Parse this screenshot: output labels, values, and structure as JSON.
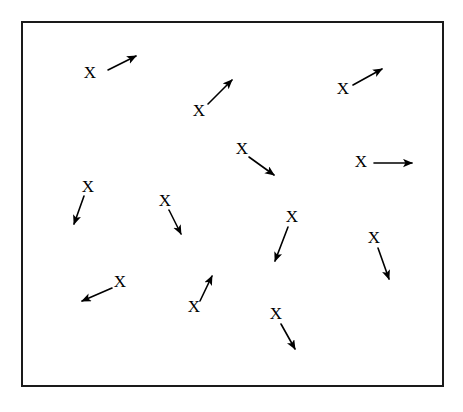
{
  "figure": {
    "background_color": "#ffffff",
    "ink_color": "#000000",
    "frame": {
      "name": "outer-border",
      "x": 22,
      "y": 22,
      "width": 421,
      "height": 364,
      "stroke_color": "#1a1a1a",
      "stroke_width": 2
    },
    "marker_glyph": "X",
    "marker_count": 13,
    "markers": [
      {
        "id": 1,
        "label": "X",
        "label_x": 90,
        "label_y": 74,
        "arrow": {
          "x1": 108,
          "y1": 70,
          "x2": 136,
          "y2": 56
        },
        "direction": "up-right"
      },
      {
        "id": 2,
        "label": "X",
        "label_x": 199,
        "label_y": 112,
        "arrow": {
          "x1": 208,
          "y1": 104,
          "x2": 232,
          "y2": 80
        },
        "direction": "up-right"
      },
      {
        "id": 3,
        "label": "X",
        "label_x": 343,
        "label_y": 90,
        "arrow": {
          "x1": 353,
          "y1": 85,
          "x2": 382,
          "y2": 69
        },
        "direction": "up-right"
      },
      {
        "id": 4,
        "label": "X",
        "label_x": 242,
        "label_y": 150,
        "arrow": {
          "x1": 249,
          "y1": 157,
          "x2": 274,
          "y2": 175
        },
        "direction": "down-right"
      },
      {
        "id": 5,
        "label": "X",
        "label_x": 361,
        "label_y": 163,
        "arrow": {
          "x1": 374,
          "y1": 163,
          "x2": 412,
          "y2": 163
        },
        "direction": "right"
      },
      {
        "id": 6,
        "label": "X",
        "label_x": 88,
        "label_y": 188,
        "arrow": {
          "x1": 84,
          "y1": 196,
          "x2": 74,
          "y2": 224
        },
        "direction": "down-left"
      },
      {
        "id": 7,
        "label": "X",
        "label_x": 165,
        "label_y": 202,
        "arrow": {
          "x1": 169,
          "y1": 210,
          "x2": 181,
          "y2": 234
        },
        "direction": "down-right"
      },
      {
        "id": 8,
        "label": "X",
        "label_x": 292,
        "label_y": 218,
        "arrow": {
          "x1": 288,
          "y1": 227,
          "x2": 275,
          "y2": 261
        },
        "direction": "down-left"
      },
      {
        "id": 9,
        "label": "X",
        "label_x": 374,
        "label_y": 239,
        "arrow": {
          "x1": 378,
          "y1": 248,
          "x2": 389,
          "y2": 279
        },
        "direction": "down-right"
      },
      {
        "id": 10,
        "label": "X",
        "label_x": 120,
        "label_y": 283,
        "arrow": {
          "x1": 112,
          "y1": 288,
          "x2": 82,
          "y2": 301
        },
        "direction": "down-left"
      },
      {
        "id": 11,
        "label": "X",
        "label_x": 194,
        "label_y": 308,
        "arrow": {
          "x1": 200,
          "y1": 301,
          "x2": 212,
          "y2": 276
        },
        "direction": "up-right"
      },
      {
        "id": 12,
        "label": "X",
        "label_x": 276,
        "label_y": 315,
        "arrow": {
          "x1": 281,
          "y1": 324,
          "x2": 295,
          "y2": 349
        },
        "direction": "down-right"
      },
      {
        "id": 13,
        "label": "X",
        "label_x": 64,
        "label_y": 0,
        "arrow": {
          "x1": 0,
          "y1": 0,
          "x2": 0,
          "y2": 0
        },
        "direction": "none",
        "hidden": true
      }
    ]
  }
}
